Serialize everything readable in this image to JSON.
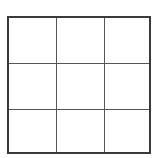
{
  "board": {
    "rows": 3,
    "cols": 3,
    "cells": [
      [
        "",
        "",
        ""
      ],
      [
        "",
        "",
        ""
      ],
      [
        "",
        "",
        ""
      ]
    ],
    "colors": {
      "outer_border": "#3a3a3a",
      "grid_line": "#555555",
      "background": "#ffffff"
    }
  }
}
